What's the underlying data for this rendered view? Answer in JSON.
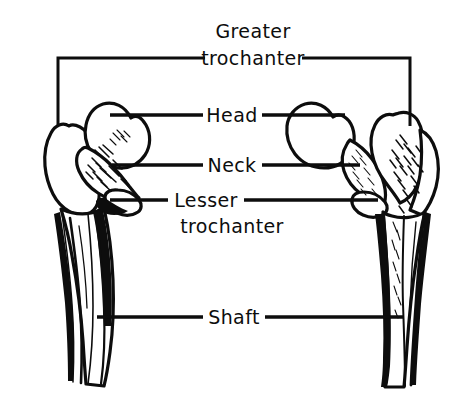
{
  "figure": {
    "background_color": "#ffffff",
    "ink_color": "#0d0d0d",
    "width": 463,
    "height": 400
  },
  "labels": {
    "greater_trochanter_line1": "Greater",
    "greater_trochanter_line2": "trochanter",
    "head": "Head",
    "neck": "Neck",
    "lesser_trochanter_line1": "Lesser",
    "lesser_trochanter_line2": "trochanter",
    "shaft": "Shaft"
  },
  "specimens": [
    {
      "name": "left-femur-proximal",
      "view": "anterior",
      "side": "left"
    },
    {
      "name": "right-femur-proximal",
      "view": "posterior",
      "side": "right"
    }
  ],
  "annotations": [
    {
      "label": "Greater trochanter",
      "style": "bracket",
      "targets": [
        "left-greater-trochanter",
        "right-greater-trochanter"
      ]
    },
    {
      "label": "Head",
      "style": "double-leader",
      "targets": [
        "left-head",
        "right-head"
      ]
    },
    {
      "label": "Neck",
      "style": "double-leader",
      "targets": [
        "left-neck",
        "right-neck"
      ]
    },
    {
      "label": "Lesser trochanter",
      "style": "double-leader",
      "targets": [
        "left-lesser-trochanter",
        "right-lesser-trochanter"
      ]
    },
    {
      "label": "Shaft",
      "style": "double-leader",
      "targets": [
        "left-shaft",
        "right-shaft"
      ]
    }
  ]
}
